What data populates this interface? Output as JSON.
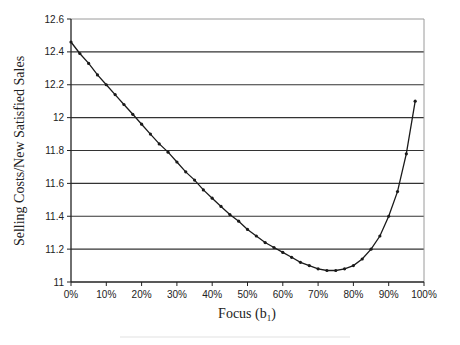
{
  "chart_data": {
    "type": "line",
    "title": "",
    "xlabel": "Focus (b",
    "xlabel_subscript": "1",
    "xlabel_close": ")",
    "ylabel": "Selling Costs/New Satisfied Sales",
    "xlim": [
      0,
      100
    ],
    "ylim": [
      11,
      12.6
    ],
    "grid": "horizontal",
    "legend": "none",
    "x_ticks": [
      "0%",
      "10%",
      "20%",
      "30%",
      "40%",
      "50%",
      "60%",
      "70%",
      "80%",
      "90%",
      "100%"
    ],
    "x_tick_values": [
      0,
      10,
      20,
      30,
      40,
      50,
      60,
      70,
      80,
      90,
      100
    ],
    "y_ticks": [
      "11",
      "11.2",
      "11.4",
      "11.6",
      "11.8",
      "12",
      "12.2",
      "12.4",
      "12.6"
    ],
    "y_tick_values": [
      11,
      11.2,
      11.4,
      11.6,
      11.8,
      12,
      12.2,
      12.4,
      12.6
    ],
    "series": [
      {
        "name": "Selling Costs/New Satisfied Sales",
        "marker": "dot",
        "color": "#1a1a1a",
        "x": [
          0,
          2.5,
          5,
          7.5,
          10,
          12.5,
          15,
          17.5,
          20,
          22.5,
          25,
          27.5,
          30,
          32.5,
          35,
          37.5,
          40,
          42.5,
          45,
          47.5,
          50,
          52.5,
          55,
          57.5,
          60,
          62.5,
          65,
          67.5,
          70,
          72.5,
          75,
          77.5,
          80,
          82.5,
          85,
          87.5,
          90,
          92.5,
          95,
          97.5
        ],
        "values": [
          12.46,
          12.39,
          12.33,
          12.26,
          12.2,
          12.14,
          12.08,
          12.02,
          11.96,
          11.9,
          11.84,
          11.79,
          11.73,
          11.67,
          11.62,
          11.56,
          11.51,
          11.46,
          11.41,
          11.37,
          11.32,
          11.28,
          11.24,
          11.21,
          11.18,
          11.15,
          11.12,
          11.1,
          11.08,
          11.07,
          11.07,
          11.08,
          11.1,
          11.14,
          11.2,
          11.28,
          11.4,
          11.55,
          11.78,
          12.1
        ]
      }
    ]
  },
  "colors": {
    "line": "#1a1a1a",
    "grid": "#333333",
    "frame": "#9a9a9a",
    "background": "#ffffff"
  }
}
